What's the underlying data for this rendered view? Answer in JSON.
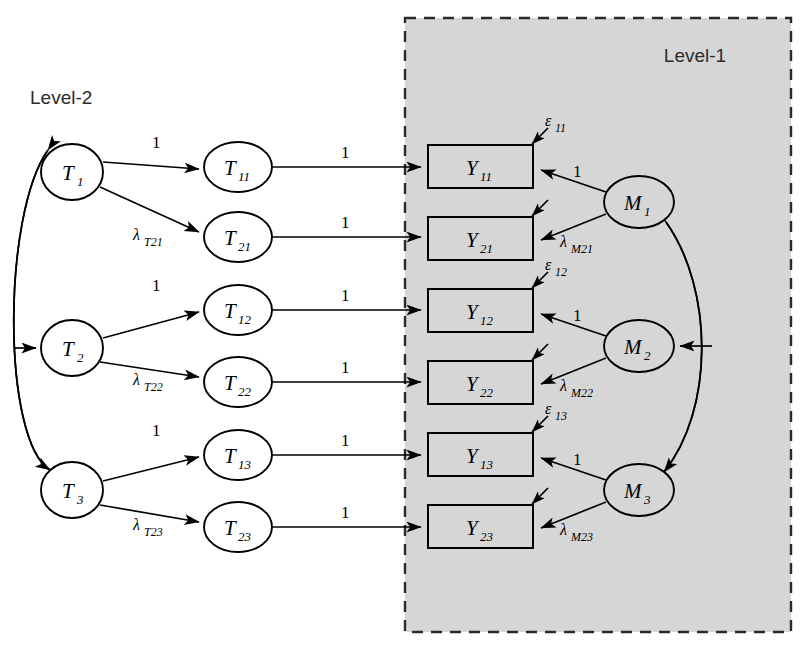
{
  "figure": {
    "type": "sem-path-diagram",
    "levels": [
      {
        "id": "level2",
        "label": "Level-2",
        "x": 30,
        "y": 104,
        "shaded": false
      },
      {
        "id": "level1",
        "label": "Level-1",
        "x": 695,
        "y": 62,
        "shaded": true
      }
    ],
    "panel": {
      "x": 405,
      "y": 18,
      "width": 386,
      "height": 614,
      "fill": "#d6d6d6",
      "border": "#2b2b2b",
      "dashed": true
    }
  },
  "latent_level2": [
    {
      "name": "T1",
      "label": "T",
      "sub": "1",
      "cx": 72,
      "cy": 172,
      "rx": 31,
      "ry": 28
    },
    {
      "name": "T2",
      "label": "T",
      "sub": "2",
      "cx": 72,
      "cy": 348,
      "rx": 31,
      "ry": 28
    },
    {
      "name": "T3",
      "label": "T",
      "sub": "3",
      "cx": 72,
      "cy": 490,
      "rx": 31,
      "ry": 28
    }
  ],
  "indicators_level2": [
    {
      "name": "T11",
      "label": "T",
      "sub": "11",
      "cx": 238,
      "cy": 167,
      "rx": 34,
      "ry": 25
    },
    {
      "name": "T21",
      "label": "T",
      "sub": "21",
      "cx": 238,
      "cy": 237,
      "rx": 34,
      "ry": 25
    },
    {
      "name": "T12",
      "label": "T",
      "sub": "12",
      "cx": 238,
      "cy": 310,
      "rx": 34,
      "ry": 25
    },
    {
      "name": "T22",
      "label": "T",
      "sub": "22",
      "cx": 238,
      "cy": 382,
      "rx": 34,
      "ry": 25
    },
    {
      "name": "T13",
      "label": "T",
      "sub": "13",
      "cx": 238,
      "cy": 455,
      "rx": 34,
      "ry": 25
    },
    {
      "name": "T23",
      "label": "T",
      "sub": "23",
      "cx": 238,
      "cy": 527,
      "rx": 34,
      "ry": 25
    }
  ],
  "observed_level1": [
    {
      "name": "Y11",
      "label": "Y",
      "sub": "11",
      "x": 428,
      "y": 145,
      "w": 105,
      "h": 43
    },
    {
      "name": "Y21",
      "label": "Y",
      "sub": "21",
      "x": 428,
      "y": 217,
      "w": 105,
      "h": 43
    },
    {
      "name": "Y12",
      "label": "Y",
      "sub": "12",
      "x": 428,
      "y": 289,
      "w": 105,
      "h": 43
    },
    {
      "name": "Y22",
      "label": "Y",
      "sub": "22",
      "x": 428,
      "y": 361,
      "w": 105,
      "h": 43
    },
    {
      "name": "Y13",
      "label": "Y",
      "sub": "13",
      "x": 428,
      "y": 433,
      "w": 105,
      "h": 43
    },
    {
      "name": "Y23",
      "label": "Y",
      "sub": "23",
      "x": 428,
      "y": 505,
      "w": 105,
      "h": 43
    }
  ],
  "latent_level1": [
    {
      "name": "M1",
      "label": "M",
      "sub": "1",
      "cx": 639,
      "cy": 202,
      "rx": 35,
      "ry": 26
    },
    {
      "name": "M2",
      "label": "M",
      "sub": "2",
      "cx": 639,
      "cy": 346,
      "rx": 35,
      "ry": 26
    },
    {
      "name": "M3",
      "label": "M",
      "sub": "3",
      "cx": 639,
      "cy": 490,
      "rx": 35,
      "ry": 26
    }
  ],
  "loadings_level2": [
    {
      "from": "T1",
      "to": "T11",
      "label": "1",
      "lx": 152,
      "ly": 148
    },
    {
      "from": "T1",
      "to": "T21",
      "label": "λ",
      "sub": "T21",
      "lx": 133,
      "ly": 240
    },
    {
      "from": "T2",
      "to": "T12",
      "label": "1",
      "lx": 152,
      "ly": 291
    },
    {
      "from": "T2",
      "to": "T22",
      "label": "λ",
      "sub": "T22",
      "lx": 133,
      "ly": 385
    },
    {
      "from": "T3",
      "to": "T13",
      "label": "1",
      "lx": 152,
      "ly": 436
    },
    {
      "from": "T3",
      "to": "T23",
      "label": "λ",
      "sub": "T23",
      "lx": 133,
      "ly": 530
    }
  ],
  "cross_level_paths": [
    {
      "from": "T11",
      "to": "Y11",
      "label": "1",
      "lx": 341,
      "ly": 158
    },
    {
      "from": "T21",
      "to": "Y21",
      "label": "1",
      "lx": 341,
      "ly": 228
    },
    {
      "from": "T12",
      "to": "Y12",
      "label": "1",
      "lx": 341,
      "ly": 301
    },
    {
      "from": "T22",
      "to": "Y22",
      "label": "1",
      "lx": 341,
      "ly": 373
    },
    {
      "from": "T13",
      "to": "Y13",
      "label": "1",
      "lx": 341,
      "ly": 446
    },
    {
      "from": "T23",
      "to": "Y23",
      "label": "1",
      "lx": 341,
      "ly": 518
    }
  ],
  "loadings_level1": [
    {
      "from": "M1",
      "to": "Y11",
      "label": "1",
      "lx": 573,
      "ly": 177
    },
    {
      "from": "M1",
      "to": "Y21",
      "label": "λ",
      "sub": "M21",
      "lx": 560,
      "ly": 247
    },
    {
      "from": "M2",
      "to": "Y12",
      "label": "1",
      "lx": 573,
      "ly": 321
    },
    {
      "from": "M2",
      "to": "Y22",
      "label": "λ",
      "sub": "M22",
      "lx": 560,
      "ly": 391
    },
    {
      "from": "M3",
      "to": "Y13",
      "label": "1",
      "lx": 573,
      "ly": 465
    },
    {
      "from": "M3",
      "to": "Y23",
      "label": "λ",
      "sub": "M23",
      "lx": 560,
      "ly": 535
    }
  ],
  "residuals": [
    {
      "name": "e11",
      "target": "Y11",
      "label": "ε",
      "sub": "11",
      "lx": 545,
      "ly": 126,
      "show_label": true
    },
    {
      "name": "e21",
      "target": "Y21",
      "label": "",
      "sub": "",
      "lx": 0,
      "ly": 0,
      "show_label": false
    },
    {
      "name": "e12",
      "target": "Y12",
      "label": "ε",
      "sub": "12",
      "lx": 545,
      "ly": 270,
      "show_label": true
    },
    {
      "name": "e22",
      "target": "Y22",
      "label": "",
      "sub": "",
      "lx": 0,
      "ly": 0,
      "show_label": false
    },
    {
      "name": "e13",
      "target": "Y13",
      "label": "ε",
      "sub": "13",
      "lx": 545,
      "ly": 414,
      "show_label": true
    },
    {
      "name": "e23",
      "target": "Y23",
      "label": "",
      "sub": "",
      "lx": 0,
      "ly": 0,
      "show_label": false
    }
  ],
  "structural_arcs": [
    {
      "name": "level2-arc",
      "from": "T1",
      "to": "T3",
      "bulge": "left"
    },
    {
      "name": "level2-mid-arrow",
      "to": "T2"
    },
    {
      "name": "level1-arc",
      "from": "M3",
      "to": "M1",
      "bulge": "right"
    },
    {
      "name": "level1-mid-arrow",
      "to": "M2"
    }
  ]
}
